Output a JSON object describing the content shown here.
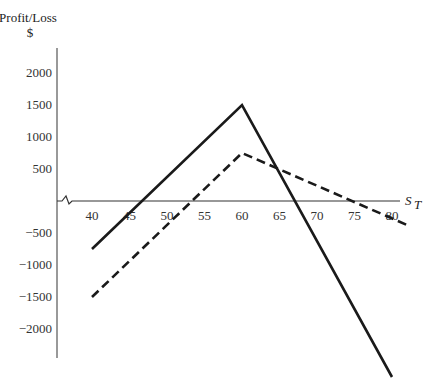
{
  "chart_data": {
    "type": "line",
    "title": "",
    "ylabel": "Profit/Loss $",
    "ylabel_line1": "Profit/Loss",
    "ylabel_line2": "$",
    "xlabel": "S_T",
    "xlabel_main": "S",
    "xlabel_sub": "T",
    "xlim": [
      33,
      82
    ],
    "ylim": [
      -2800,
      2400
    ],
    "x_ticks": [
      "40",
      "45",
      "50",
      "55",
      "60",
      "65",
      "70",
      "75",
      "80"
    ],
    "y_ticks": [
      "2000",
      "1500",
      "1000",
      "500",
      "-500",
      "-1000",
      "-1500",
      "-2000"
    ],
    "grid": false,
    "legend": null,
    "axis_break": "zigzag near origin on x-axis",
    "series": [
      {
        "name": "solid",
        "style": "solid",
        "color": "#1a1a1a",
        "points": [
          [
            40,
            -750
          ],
          [
            60,
            1500
          ],
          [
            80,
            -2750
          ]
        ]
      },
      {
        "name": "dashed",
        "style": "dashed",
        "color": "#1a1a1a",
        "points": [
          [
            40,
            -1500
          ],
          [
            60,
            750
          ],
          [
            82,
            -375
          ]
        ]
      }
    ]
  }
}
